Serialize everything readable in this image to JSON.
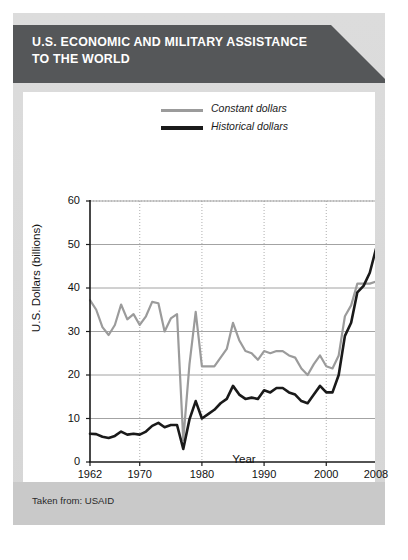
{
  "banner": {
    "title": "U.S. ECONOMIC AND MILITARY ASSISTANCE TO THE WORLD",
    "bg_color": "#555759",
    "text_color": "#ffffff"
  },
  "footer": {
    "source_text": "Taken from: USAID",
    "bg_color": "#c9c9c9"
  },
  "chart_data": {
    "type": "line",
    "title": "U.S. ECONOMIC AND MILITARY ASSISTANCE TO THE WORLD",
    "xlabel": "Year",
    "ylabel": "U.S. Dollars (billions)",
    "xlim": [
      1962,
      2008
    ],
    "ylim": [
      0,
      60
    ],
    "xticks": [
      1962,
      1970,
      1980,
      1990,
      2000,
      2008
    ],
    "xtick_labels": [
      "1962",
      "1970",
      "1980",
      "1990",
      "2000",
      "2008"
    ],
    "yticks": [
      0,
      10,
      20,
      30,
      40,
      50,
      60
    ],
    "ytick_labels": [
      "0",
      "10",
      "20",
      "30",
      "40",
      "50",
      "60"
    ],
    "grid": true,
    "legend_position": "top-center",
    "legend": [
      "Constant dollars",
      "Historical dollars"
    ],
    "series": [
      {
        "name": "Constant dollars",
        "color": "#9b9b9b",
        "x": [
          1962,
          1963,
          1964,
          1965,
          1966,
          1967,
          1968,
          1969,
          1970,
          1971,
          1972,
          1973,
          1974,
          1975,
          1976,
          1977,
          1978,
          1979,
          1980,
          1981,
          1982,
          1983,
          1984,
          1985,
          1986,
          1987,
          1988,
          1989,
          1990,
          1991,
          1992,
          1993,
          1994,
          1995,
          1996,
          1997,
          1998,
          1999,
          2000,
          2001,
          2002,
          2003,
          2004,
          2005,
          2006,
          2007,
          2008
        ],
        "values": [
          37.2,
          35.0,
          31.0,
          29.2,
          31.5,
          36.2,
          32.8,
          34.0,
          31.5,
          33.5,
          36.8,
          36.5,
          30.0,
          33.0,
          34.0,
          5.0,
          22.5,
          34.5,
          22.0,
          22.0,
          22.0,
          24.0,
          26.0,
          32.0,
          28.0,
          25.5,
          25.0,
          23.5,
          25.5,
          25.0,
          25.5,
          25.5,
          24.5,
          24.0,
          21.5,
          20.0,
          22.5,
          24.5,
          22.0,
          21.5,
          24.5,
          33.5,
          36.0,
          41.0,
          41.0,
          41.0,
          41.5
        ]
      },
      {
        "name": "Historical dollars",
        "color": "#1a1a1a",
        "x": [
          1962,
          1963,
          1964,
          1965,
          1966,
          1967,
          1968,
          1969,
          1970,
          1971,
          1972,
          1973,
          1974,
          1975,
          1976,
          1977,
          1978,
          1979,
          1980,
          1981,
          1982,
          1983,
          1984,
          1985,
          1986,
          1987,
          1988,
          1989,
          1990,
          1991,
          1992,
          1993,
          1994,
          1995,
          1996,
          1997,
          1998,
          1999,
          2000,
          2001,
          2002,
          2003,
          2004,
          2005,
          2006,
          2007,
          2008
        ],
        "values": [
          6.5,
          6.4,
          5.8,
          5.5,
          6.0,
          7.0,
          6.3,
          6.5,
          6.3,
          7.0,
          8.3,
          9.0,
          8.0,
          8.5,
          8.5,
          3.0,
          9.8,
          14.0,
          10.0,
          11.0,
          12.0,
          13.5,
          14.5,
          17.5,
          15.5,
          14.5,
          14.8,
          14.5,
          16.5,
          16.0,
          17.0,
          17.0,
          16.0,
          15.5,
          14.0,
          13.5,
          15.5,
          17.5,
          16.0,
          16.0,
          20.0,
          29.0,
          32.0,
          39.0,
          40.5,
          43.5,
          49.0
        ]
      }
    ]
  }
}
